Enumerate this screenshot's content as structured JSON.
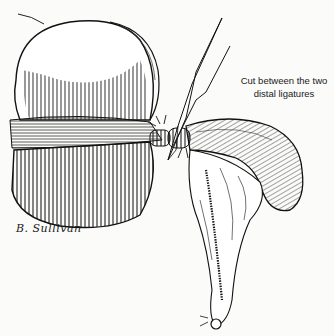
{
  "figure": {
    "caption_line1": "Cut between the two",
    "caption_line2": "distal ligatures",
    "signature": "B. Sullivan",
    "colors": {
      "ink": "#1a1a1a",
      "background": "#fbfbfa"
    }
  }
}
